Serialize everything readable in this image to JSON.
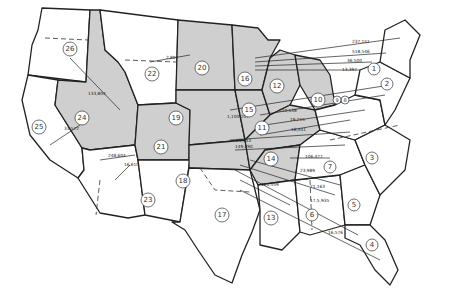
{
  "map": {
    "type": "flow map",
    "subject": "United States with numbered regions and migration/flow arrows",
    "shaded_regions": [
      "10",
      "11",
      "12",
      "14",
      "15",
      "16",
      "18",
      "19",
      "20",
      "21",
      "24"
    ],
    "regions": [
      {
        "id": "1",
        "x": 374,
        "y": 69
      },
      {
        "id": "2",
        "x": 387,
        "y": 84
      },
      {
        "id": "3",
        "x": 372,
        "y": 158
      },
      {
        "id": "4",
        "x": 372,
        "y": 245
      },
      {
        "id": "5",
        "x": 354,
        "y": 205
      },
      {
        "id": "6",
        "x": 312,
        "y": 215
      },
      {
        "id": "7",
        "x": 330,
        "y": 167
      },
      {
        "id": "8",
        "x": 342,
        "y": 100
      },
      {
        "id": "9",
        "x": 337,
        "y": 100
      },
      {
        "id": "10",
        "x": 318,
        "y": 100
      },
      {
        "id": "11",
        "x": 262,
        "y": 128
      },
      {
        "id": "12",
        "x": 277,
        "y": 86
      },
      {
        "id": "13",
        "x": 271,
        "y": 218
      },
      {
        "id": "14",
        "x": 271,
        "y": 159
      },
      {
        "id": "15",
        "x": 249,
        "y": 110
      },
      {
        "id": "16",
        "x": 245,
        "y": 79
      },
      {
        "id": "17",
        "x": 222,
        "y": 215
      },
      {
        "id": "18",
        "x": 183,
        "y": 181
      },
      {
        "id": "19",
        "x": 176,
        "y": 118
      },
      {
        "id": "20",
        "x": 202,
        "y": 68
      },
      {
        "id": "21",
        "x": 161,
        "y": 147
      },
      {
        "id": "22",
        "x": 152,
        "y": 74
      },
      {
        "id": "23",
        "x": 148,
        "y": 200
      },
      {
        "id": "24",
        "x": 82,
        "y": 118
      },
      {
        "id": "25",
        "x": 39,
        "y": 127
      },
      {
        "id": "26",
        "x": 70,
        "y": 49
      }
    ],
    "flows": [
      {
        "label": "237,151",
        "x": 352,
        "y": 43
      },
      {
        "label": "518,546",
        "x": 352,
        "y": 53
      },
      {
        "label": "36,500",
        "x": 347,
        "y": 62
      },
      {
        "label": "13,397",
        "x": 342,
        "y": 71
      },
      {
        "label": "2,807",
        "x": 166,
        "y": 59
      },
      {
        "label": "133,804",
        "x": 88,
        "y": 95
      },
      {
        "label": "33,572",
        "x": 64,
        "y": 130
      },
      {
        "label": "248,604",
        "x": 108,
        "y": 157
      },
      {
        "label": "16,610",
        "x": 124,
        "y": 166
      },
      {
        "label": "1,100,207",
        "x": 227,
        "y": 118
      },
      {
        "label": "210,538",
        "x": 279,
        "y": 112
      },
      {
        "label": "19,215",
        "x": 290,
        "y": 121
      },
      {
        "label": "18,441",
        "x": 291,
        "y": 131
      },
      {
        "label": "23,443",
        "x": 236,
        "y": 142
      },
      {
        "label": "149,290",
        "x": 235,
        "y": 148
      },
      {
        "label": "106,477",
        "x": 305,
        "y": 158
      },
      {
        "label": "23,989",
        "x": 300,
        "y": 172
      },
      {
        "label": "71,163",
        "x": 310,
        "y": 188
      },
      {
        "label": "17,5,935",
        "x": 310,
        "y": 202
      },
      {
        "label": "121,559",
        "x": 261,
        "y": 186
      },
      {
        "label": "16,576",
        "x": 328,
        "y": 234
      }
    ]
  }
}
